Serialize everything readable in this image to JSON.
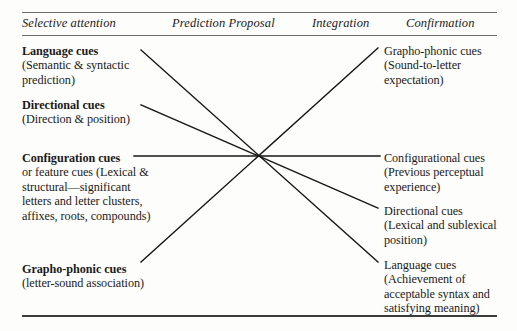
{
  "figure": {
    "columns": [
      {
        "key": "selective_attention",
        "label": "Selective attention"
      },
      {
        "key": "prediction_proposal",
        "label": "Prediction Proposal"
      },
      {
        "key": "integration",
        "label": "Integration"
      },
      {
        "key": "confirmation",
        "label": "Confirmation"
      }
    ],
    "left_column": [
      {
        "key": "language_cues",
        "heading": "Language cues",
        "body": "(Semantic & syntactic prediction)"
      },
      {
        "key": "directional_cues",
        "heading": "Directional cues",
        "body": "(Direction & position)"
      },
      {
        "key": "configuration_cues",
        "heading": "Configuration cues",
        "body": "or feature cues (Lexical & structural—significant letters and letter clusters, affixes, roots, compounds)"
      },
      {
        "key": "grapho_phonic_cues",
        "heading": "Grapho-phonic cues",
        "body": "(letter-sound association)"
      }
    ],
    "right_column": [
      {
        "key": "grapho_phonic_cues",
        "heading": "Grapho-phonic cues",
        "body": "(Sound-to-letter expectation)"
      },
      {
        "key": "configurational_cues",
        "heading": "Configurational cues",
        "body": "(Previous perceptual experience)"
      },
      {
        "key": "directional_cues",
        "heading": "Directional cues",
        "body": "(Lexical and sublexical position)"
      },
      {
        "key": "language_cues",
        "heading": "Language cues",
        "body": "(Achievement of acceptable syntax and satisfying meaning)"
      }
    ],
    "connectors": [
      {
        "key": "language-to-language",
        "x1": 141,
        "y1": 50,
        "x2": 378,
        "y2": 262
      },
      {
        "key": "directional-to-directional",
        "x1": 141,
        "y1": 105,
        "x2": 378,
        "y2": 208
      },
      {
        "key": "configuration-to-configurational",
        "x1": 134,
        "y1": 156,
        "x2": 380,
        "y2": 156
      },
      {
        "key": "graphophonic-to-graphophonic",
        "x1": 141,
        "y1": 262,
        "x2": 378,
        "y2": 48
      }
    ],
    "colors": {
      "line": "#161616",
      "rule": "#4a4a4a",
      "text": "#1a1a1a",
      "background": "#fdfdfc"
    }
  }
}
